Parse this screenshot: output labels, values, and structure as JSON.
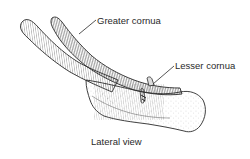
{
  "figure": {
    "caption": "Lateral view",
    "labels": [
      {
        "id": "greater-cornua",
        "text": "Greater cornua"
      },
      {
        "id": "lesser-cornua",
        "text": "Lesser cornua"
      }
    ],
    "colors": {
      "ink": "#2a2a2a",
      "background": "#ffffff"
    }
  }
}
